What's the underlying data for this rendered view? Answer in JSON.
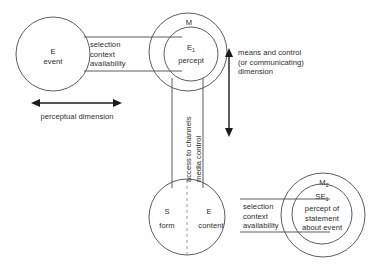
{
  "diagram": {
    "nodes": {
      "event_circle": {
        "name": "E event",
        "symbol": "E",
        "label": "event"
      },
      "percept_outer": {
        "name": "M",
        "symbol": "M"
      },
      "percept_inner": {
        "name": "E1 percept",
        "symbol": "E",
        "subscript": "1",
        "label": "percept"
      },
      "statement_circle": {
        "name": "S form / E content",
        "left_symbol": "S",
        "left_label": "form",
        "right_symbol": "E",
        "right_label": "content"
      },
      "statement_percept_outer": {
        "name": "M2",
        "symbol": "M",
        "subscript": "2"
      },
      "statement_percept_inner": {
        "name": "SE1 percept of statement about event",
        "symbol": "SE",
        "subscript": "1",
        "label_line1": "percept of",
        "label_line2": "statement",
        "label_line3": "about event"
      }
    },
    "bands": {
      "top_band": {
        "line1": "selection",
        "line2": "context",
        "line3": "availability"
      },
      "bottom_band": {
        "line1": "selection",
        "line2": "context",
        "line3": "availability"
      },
      "vertical_band": {
        "line1": "access to channels",
        "line2": "media control"
      }
    },
    "axes": {
      "horizontal": {
        "label": "perceptual dimension"
      },
      "vertical": {
        "line1": "means and control",
        "line2": "(or communicating)",
        "line3": "dimension"
      }
    },
    "colors": {
      "stroke": "#4a4a4a",
      "dashed_stroke": "#8c8c8c",
      "arrow": "#1c1c1c",
      "text": "#2b2b2b",
      "background": "#ffffff"
    }
  }
}
